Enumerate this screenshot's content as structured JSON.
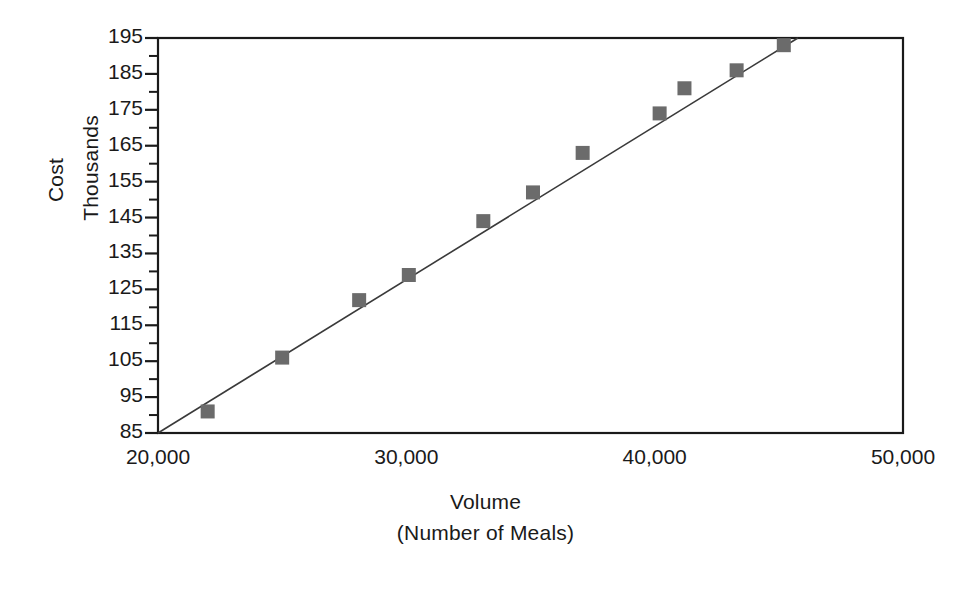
{
  "chart_data": {
    "type": "scatter",
    "title": "",
    "xlabel": "Volume",
    "xlabel_sub": "(Number of Meals)",
    "ylabel": "Cost",
    "ylabel_sub": "Thousands",
    "xlim": [
      20000,
      50000
    ],
    "ylim": [
      85,
      195
    ],
    "grid": false,
    "legend": false,
    "x_tick_labels": [
      "20,000",
      "30,000",
      "40,000",
      "50,000"
    ],
    "x_tick_values": [
      20000,
      30000,
      40000,
      50000
    ],
    "y_tick_labels": [
      "85",
      "95",
      "105",
      "115",
      "125",
      "135",
      "145",
      "155",
      "165",
      "175",
      "185",
      "195"
    ],
    "y_tick_values": [
      85,
      95,
      105,
      115,
      125,
      135,
      145,
      155,
      165,
      175,
      185,
      195
    ],
    "y_minor_ticks": [
      90,
      100,
      110,
      120,
      130,
      140,
      150,
      160,
      170,
      180,
      190
    ],
    "marker_shape": "square",
    "marker_color": "#6b6b6b",
    "line_color": "#3a3a3a",
    "axis_color": "#1a1a1a",
    "series": [
      {
        "name": "Cost observations",
        "points": [
          {
            "x": 22000,
            "y": 91
          },
          {
            "x": 25000,
            "y": 106
          },
          {
            "x": 28100,
            "y": 122
          },
          {
            "x": 30100,
            "y": 129
          },
          {
            "x": 33100,
            "y": 144
          },
          {
            "x": 35100,
            "y": 152
          },
          {
            "x": 37100,
            "y": 163
          },
          {
            "x": 40200,
            "y": 174
          },
          {
            "x": 41200,
            "y": 181
          },
          {
            "x": 43300,
            "y": 186
          },
          {
            "x": 45200,
            "y": 193
          }
        ]
      }
    ],
    "trendline": {
      "name": "Fitted cost line",
      "x_start": 20000,
      "y_start": 85,
      "x_end": 46000,
      "y_end": 196
    }
  }
}
